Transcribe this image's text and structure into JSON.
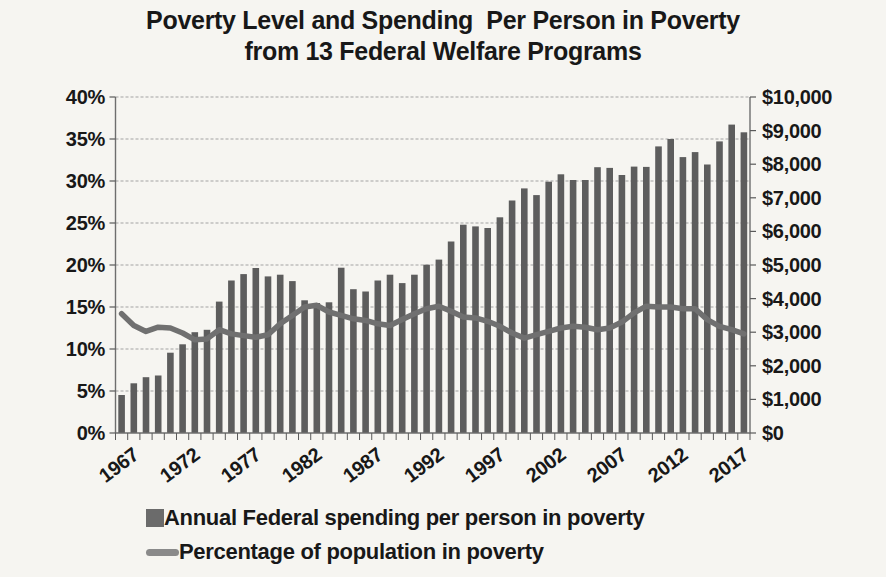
{
  "title": {
    "line1": "Poverty Level and Spending  Per Person in Poverty",
    "line2": "from 13 Federal Welfare Programs"
  },
  "legend": {
    "bar_series_label": "Annual Federal spending per person in poverty",
    "line_series_label": "Percentage of population in poverty"
  },
  "colors": {
    "background": "#f6f5f1",
    "text": "#181818",
    "bar": "#5d5d5d",
    "line": "#707070",
    "grid": "#a3a3a3",
    "axis": "#6e6e6e",
    "tick": "#5a5a5a",
    "legend_bar_swatch": "#6b6b6b",
    "legend_line_swatch": "#8a8a8a"
  },
  "chart_data": {
    "type": "combo",
    "title": "Poverty Level and Spending  Per Person in Poverty from 13 Federal Welfare Programs",
    "x": [
      1967,
      1968,
      1969,
      1970,
      1971,
      1972,
      1973,
      1974,
      1975,
      1976,
      1977,
      1978,
      1979,
      1980,
      1981,
      1982,
      1983,
      1984,
      1985,
      1986,
      1987,
      1988,
      1989,
      1990,
      1991,
      1992,
      1993,
      1994,
      1995,
      1996,
      1997,
      1998,
      1999,
      2000,
      2001,
      2002,
      2003,
      2004,
      2005,
      2006,
      2007,
      2008,
      2009,
      2010,
      2011,
      2012,
      2013,
      2014,
      2015,
      2016,
      2017,
      2018
    ],
    "series": [
      {
        "name": "Annual Federal spending per person in poverty",
        "type": "bar",
        "yaxis": "right",
        "values": [
          1130,
          1480,
          1660,
          1710,
          2390,
          2640,
          3000,
          3070,
          3910,
          4540,
          4730,
          4910,
          4660,
          4710,
          4520,
          3950,
          3870,
          3890,
          4920,
          4280,
          4210,
          4540,
          4710,
          4460,
          4710,
          5010,
          5160,
          5700,
          6200,
          6150,
          6100,
          6420,
          6920,
          7280,
          7080,
          7480,
          7700,
          7530,
          7530,
          7910,
          7890,
          7680,
          7930,
          7920,
          8530,
          8750,
          8210,
          8360,
          7990,
          8680,
          9180,
          8950
        ]
      },
      {
        "name": "Percentage of population in poverty",
        "type": "line",
        "yaxis": "left",
        "values": [
          14.2,
          12.8,
          12.1,
          12.6,
          12.5,
          11.9,
          11.1,
          11.2,
          12.3,
          11.8,
          11.6,
          11.4,
          11.7,
          13.0,
          14.0,
          15.0,
          15.2,
          14.4,
          14.0,
          13.6,
          13.4,
          13.0,
          12.8,
          13.5,
          14.2,
          14.8,
          15.1,
          14.5,
          13.8,
          13.7,
          13.3,
          12.7,
          11.9,
          11.3,
          11.7,
          12.1,
          12.5,
          12.7,
          12.6,
          12.3,
          12.5,
          13.2,
          14.3,
          15.1,
          15.0,
          15.0,
          14.8,
          14.8,
          13.5,
          12.7,
          12.3,
          11.8
        ]
      }
    ],
    "left_axis": {
      "min": 0,
      "max": 40,
      "tick_step": 5,
      "tick_labels": [
        "0%",
        "5%",
        "10%",
        "15%",
        "20%",
        "25%",
        "30%",
        "35%",
        "40%"
      ]
    },
    "right_axis": {
      "min": 0,
      "max": 10000,
      "tick_step": 1000,
      "tick_labels": [
        "$0",
        "$1,000",
        "$2,000",
        "$3,000",
        "$4,000",
        "$5,000",
        "$6,000",
        "$7,000",
        "$8,000",
        "$9,000",
        "$10,000"
      ]
    },
    "x_axis": {
      "labeled_years": [
        1967,
        1972,
        1977,
        1982,
        1987,
        1992,
        1997,
        2002,
        2007,
        2012,
        2017
      ]
    },
    "grid": true,
    "legend_position": "bottom-left"
  }
}
